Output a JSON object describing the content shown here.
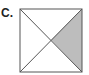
{
  "label": "C.",
  "figure": {
    "shape": "square",
    "divisions": "both diagonals, 4 triangles",
    "shaded_region": "right triangle",
    "shaded_count": 1,
    "total_regions": 4,
    "colors": {
      "stroke": "#555555",
      "shade": "#bdbdbd",
      "background": "#ffffff"
    }
  }
}
